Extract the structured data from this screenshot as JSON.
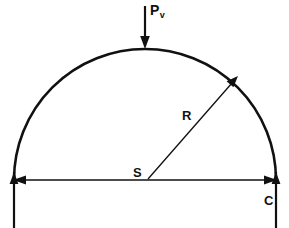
{
  "figure": {
    "type": "engineering-diagram",
    "background_color": "#ffffff",
    "line_color": "#111111"
  },
  "labels": {
    "load": {
      "base": "P",
      "subscript": "v",
      "name": "vertical-load"
    },
    "radius": {
      "text": "R",
      "name": "arch-radius"
    },
    "span": {
      "text": "S",
      "name": "arch-span"
    },
    "crown_support": {
      "text": "C",
      "name": "support-c"
    }
  },
  "geometry": {
    "arc": {
      "center_x": 145,
      "center_y": 180,
      "radius": 131,
      "start_x": 14,
      "end_x": 276,
      "apex_x": 145,
      "apex_y": 49
    },
    "span_line": {
      "y": 180,
      "left_x": 14,
      "right_x": 276
    },
    "radius_line": {
      "from_x": 148,
      "from_y": 179,
      "to_x": 237,
      "to_y": 78,
      "angle_deg": 48
    },
    "load_arrow": {
      "x": 145,
      "top_y": 6,
      "tip_y": 47
    },
    "extension_lines": [
      {
        "x": 14,
        "top_y": 176,
        "bottom_y": 228
      },
      {
        "x": 276,
        "top_y": 176,
        "bottom_y": 228
      }
    ]
  },
  "icons": {
    "down_arrowhead": "down-arrow-icon",
    "left_arrowhead": "left-arrow-icon",
    "right_arrowhead": "right-arrow-icon",
    "radius_arrowhead": "radius-arrow-icon"
  }
}
